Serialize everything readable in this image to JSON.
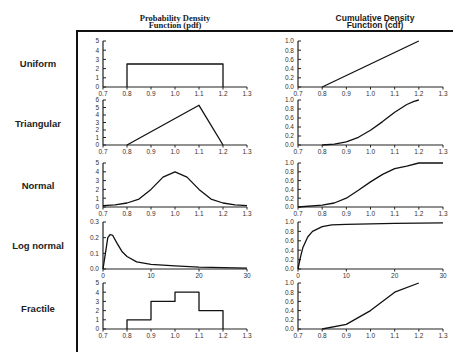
{
  "columns": {
    "pdf_title": [
      "Probability Density",
      "Function (pdf)"
    ],
    "cdf_title": [
      "Cumulative Density",
      "Function (cdf)"
    ]
  },
  "rows": [
    {
      "label": "Uniform"
    },
    {
      "label": "Triangular"
    },
    {
      "label": "Normal"
    },
    {
      "label": "Log normal"
    },
    {
      "label": "Fractile"
    }
  ],
  "chart_data": [
    {
      "type": "line",
      "row": "Uniform",
      "panel": "pdf",
      "x": [
        0.8,
        0.8,
        1.2,
        1.2
      ],
      "y": [
        0,
        2.5,
        2.5,
        0
      ],
      "xticks": [
        "0.7",
        "0.8",
        "0.9",
        "1.0",
        "1.1",
        "1.2",
        "1.3"
      ],
      "yticks": [
        "0",
        "1",
        "2",
        "3",
        "4",
        "5"
      ],
      "xlim": [
        0.7,
        1.3
      ],
      "ylim": [
        0,
        5
      ]
    },
    {
      "type": "line",
      "row": "Uniform",
      "panel": "cdf",
      "x": [
        0.8,
        1.2
      ],
      "y": [
        0,
        1.0
      ],
      "xticks": [
        "0.7",
        "0.8",
        "0.9",
        "1.0",
        "1.1",
        "1.2",
        "1.3"
      ],
      "yticks": [
        "0.0",
        "0.2",
        "0.4",
        "0.6",
        "0.8",
        "1.0"
      ],
      "xlim": [
        0.7,
        1.3
      ],
      "ylim": [
        0,
        1
      ]
    },
    {
      "type": "line",
      "row": "Triangular",
      "panel": "pdf",
      "x": [
        0.8,
        1.1,
        1.2
      ],
      "y": [
        0,
        5.3,
        0
      ],
      "xticks": [
        "0.7",
        "0.8",
        "0.9",
        "1.0",
        "1.1",
        "1.2",
        "1.3"
      ],
      "yticks": [
        "0",
        "1",
        "2",
        "3",
        "4",
        "5",
        "6"
      ],
      "xlim": [
        0.7,
        1.3
      ],
      "ylim": [
        0,
        6
      ]
    },
    {
      "type": "line",
      "row": "Triangular",
      "panel": "cdf",
      "x": [
        0.8,
        0.85,
        0.9,
        0.95,
        1.0,
        1.05,
        1.1,
        1.15,
        1.18,
        1.2
      ],
      "y": [
        0,
        0.02,
        0.07,
        0.17,
        0.33,
        0.52,
        0.73,
        0.9,
        0.97,
        1.0
      ],
      "xticks": [
        "0.7",
        "0.8",
        "0.9",
        "1.0",
        "1.1",
        "1.2",
        "1.3"
      ],
      "yticks": [
        "0.0",
        "0.2",
        "0.4",
        "0.6",
        "0.8",
        "1.0"
      ],
      "xlim": [
        0.7,
        1.3
      ],
      "ylim": [
        0,
        1
      ]
    },
    {
      "type": "line",
      "row": "Normal",
      "panel": "pdf",
      "x": [
        0.7,
        0.75,
        0.8,
        0.85,
        0.9,
        0.95,
        1.0,
        1.05,
        1.1,
        1.15,
        1.2,
        1.25,
        1.3
      ],
      "y": [
        0.15,
        0.25,
        0.45,
        0.9,
        2.0,
        3.4,
        4.0,
        3.4,
        2.0,
        0.9,
        0.45,
        0.25,
        0.15
      ],
      "xticks": [
        "0.7",
        "0.8",
        "0.9",
        "1.0",
        "1.1",
        "1.2",
        "1.3"
      ],
      "yticks": [
        "0",
        "1",
        "2",
        "3",
        "4",
        "5"
      ],
      "xlim": [
        0.7,
        1.3
      ],
      "ylim": [
        0,
        5
      ]
    },
    {
      "type": "line",
      "row": "Normal",
      "panel": "cdf",
      "x": [
        0.7,
        0.8,
        0.85,
        0.9,
        0.95,
        1.0,
        1.05,
        1.1,
        1.15,
        1.2,
        1.3
      ],
      "y": [
        0,
        0.04,
        0.09,
        0.2,
        0.38,
        0.57,
        0.74,
        0.87,
        0.93,
        1.0,
        1.0
      ],
      "xticks": [
        "0.7",
        "0.8",
        "0.9",
        "1.0",
        "1.1",
        "1.2",
        "1.3"
      ],
      "yticks": [
        "0.0",
        "0.2",
        "0.4",
        "0.6",
        "0.8",
        "1.0"
      ],
      "xlim": [
        0.7,
        1.3
      ],
      "ylim": [
        0,
        1
      ]
    },
    {
      "type": "line",
      "row": "Log normal",
      "panel": "pdf",
      "x": [
        0,
        0.5,
        1,
        1.5,
        2,
        3,
        4,
        5,
        7,
        10,
        15,
        20,
        25,
        30
      ],
      "y": [
        0,
        0.1,
        0.2,
        0.22,
        0.215,
        0.16,
        0.11,
        0.08,
        0.045,
        0.03,
        0.02,
        0.012,
        0.008,
        0.005
      ],
      "xticks": [
        "0",
        "10",
        "20",
        "30"
      ],
      "yticks": [
        "0.0",
        "0.1",
        "0.2",
        "0.3"
      ],
      "xlim": [
        0,
        30
      ],
      "ylim": [
        0,
        0.3
      ]
    },
    {
      "type": "line",
      "row": "Log normal",
      "panel": "cdf",
      "x": [
        0,
        0.5,
        1,
        2,
        3,
        5,
        7,
        10,
        20,
        30
      ],
      "y": [
        0,
        0.25,
        0.45,
        0.68,
        0.8,
        0.9,
        0.94,
        0.95,
        0.97,
        0.98
      ],
      "xticks": [
        "0",
        "10",
        "20",
        "30"
      ],
      "yticks": [
        "0.0",
        "0.2",
        "0.4",
        "0.6",
        "0.8",
        "1.0"
      ],
      "xlim": [
        0,
        30
      ],
      "ylim": [
        0,
        1
      ]
    },
    {
      "type": "line",
      "row": "Fractile",
      "panel": "pdf",
      "x": [
        0.8,
        0.8,
        0.9,
        0.9,
        1.0,
        1.0,
        1.1,
        1.1,
        1.2,
        1.2
      ],
      "y": [
        0,
        1,
        1,
        3,
        3,
        4,
        4,
        2,
        2,
        0
      ],
      "xticks": [
        "0.7",
        "0.8",
        "0.9",
        "1.0",
        "1.1",
        "1.2",
        "1.3"
      ],
      "yticks": [
        "0",
        "1",
        "2",
        "3",
        "4",
        "5"
      ],
      "xlim": [
        0.7,
        1.3
      ],
      "ylim": [
        0,
        5
      ]
    },
    {
      "type": "line",
      "row": "Fractile",
      "panel": "cdf",
      "x": [
        0.8,
        0.9,
        1.0,
        1.1,
        1.2
      ],
      "y": [
        0,
        0.1,
        0.4,
        0.8,
        1.0
      ],
      "xticks": [
        "0.7",
        "0.8",
        "0.9",
        "1.0",
        "1.1",
        "1.2",
        "1.3"
      ],
      "yticks": [
        "0.0",
        "0.2",
        "0.4",
        "0.6",
        "0.8",
        "1.0"
      ],
      "xlim": [
        0.7,
        1.3
      ],
      "ylim": [
        0,
        1
      ]
    }
  ]
}
